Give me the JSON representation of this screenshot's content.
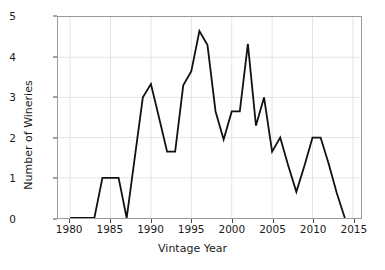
{
  "chart_data": {
    "type": "line",
    "title": "",
    "xlabel": "Vintage Year",
    "ylabel": "Number of Wineries",
    "xlim": [
      1978.5,
      2016
    ],
    "ylim": [
      0,
      5
    ],
    "xticks": [
      1980,
      1985,
      1990,
      1995,
      2000,
      2005,
      2010,
      2015
    ],
    "yticks": [
      0,
      1,
      2,
      3,
      4,
      5
    ],
    "xtick_labels": [
      "1980",
      "1985",
      "1990",
      "1995",
      "2000",
      "2005",
      "2010",
      "2015"
    ],
    "ytick_labels": [
      "0",
      "1",
      "2",
      "3",
      "4",
      "5"
    ],
    "grid": true,
    "legend": "none",
    "line_color": "#111111",
    "grid_color": "#e4e4e4",
    "frame_color": "#9a9a9a",
    "x": [
      1980,
      1981,
      1982,
      1983,
      1984,
      1985,
      1986,
      1987,
      1988,
      1989,
      1990,
      1991,
      1992,
      1993,
      1994,
      1995,
      1996,
      1997,
      1998,
      1999,
      2000,
      2001,
      2002,
      2003,
      2004,
      2005,
      2006,
      2007,
      2008,
      2009,
      2010,
      2011,
      2012,
      2013,
      2014
    ],
    "values": [
      0,
      0,
      0,
      0,
      1,
      1,
      1,
      0,
      1.5,
      3.0,
      3.33,
      2.5,
      1.65,
      1.65,
      3.3,
      3.65,
      4.65,
      4.3,
      2.65,
      1.95,
      2.65,
      2.65,
      4.33,
      2.3,
      3.0,
      1.65,
      2.0,
      1.3,
      0.65,
      1.3,
      2.0,
      2.0,
      1.35,
      0.62,
      0.0
    ]
  },
  "axes": {
    "x_title": "Vintage Year",
    "y_title": "Number of Wineries"
  }
}
